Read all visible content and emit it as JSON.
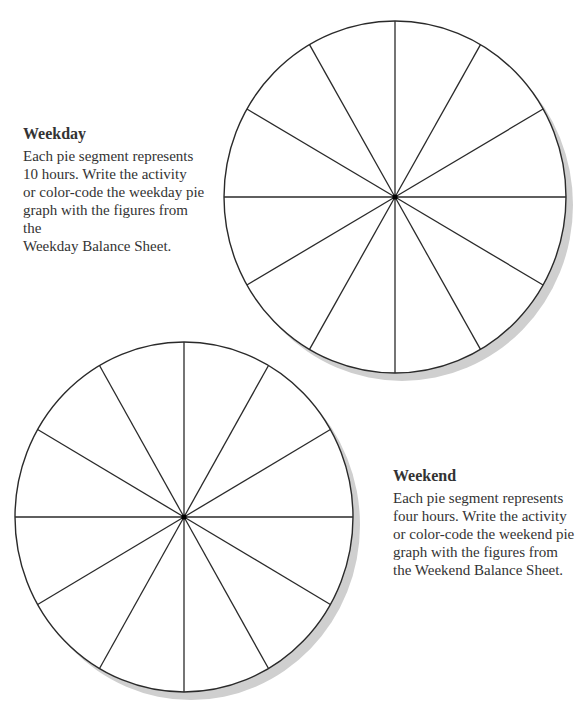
{
  "weekday": {
    "heading": "Weekday",
    "lines": [
      "Each pie segment represents",
      "10 hours. Write the activity",
      "or color-code the weekday pie",
      "graph with the figures from the",
      "Weekday Balance Sheet."
    ]
  },
  "weekend": {
    "heading": "Weekend",
    "lines": [
      "Each pie segment represents",
      "four hours. Write the activity",
      "or color-code the weekend pie",
      "graph with the figures from",
      "the Weekend Balance Sheet."
    ]
  },
  "pies": [
    {
      "name": "weekday-pie",
      "cx": 395,
      "cy": 197,
      "rx": 171,
      "ry": 176,
      "segments": 12,
      "hours_per_segment": 10
    },
    {
      "name": "weekend-pie",
      "cx": 184,
      "cy": 517,
      "rx": 169,
      "ry": 175,
      "segments": 12,
      "hours_per_segment": 4
    }
  ],
  "colors": {
    "line": "#2a2a2a",
    "shadow": "#cfcfcf",
    "text": "#333333",
    "fill": "#ffffff"
  }
}
